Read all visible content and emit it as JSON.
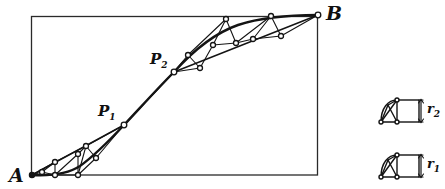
{
  "figure": {
    "type": "geometric-construction-diagram",
    "background": "#ffffff",
    "stroke_color": "#141414",
    "node_fill": "#ffffff",
    "labels": {
      "A": "A",
      "B": "B",
      "P1_base": "P",
      "P1_sub": "1",
      "P2_base": "P",
      "P2_sub": "2",
      "r1_base": "r",
      "r1_sub": "1",
      "r2_base": "r",
      "r2_sub": "2"
    },
    "frame": {
      "x": 31,
      "y": 16,
      "width": 287,
      "height": 159
    },
    "main_curve_note": "S-shaped curve from A through P1 and P2 to B",
    "chord_polyline": [
      [
        32,
        175
      ],
      [
        124,
        125
      ],
      [
        174,
        72
      ],
      [
        318,
        15
      ]
    ],
    "curve_path": [
      [
        32,
        175
      ],
      [
        55,
        175
      ],
      [
        78,
        173
      ],
      [
        96,
        158
      ],
      [
        112,
        140
      ],
      [
        124,
        125
      ],
      [
        140,
        108
      ],
      [
        156,
        90
      ],
      [
        174,
        72
      ],
      [
        196,
        50
      ],
      [
        218,
        35
      ],
      [
        244,
        24
      ],
      [
        272,
        18
      ],
      [
        296,
        16
      ],
      [
        318,
        15
      ]
    ],
    "nodes": [
      {
        "name": "A",
        "x": 32,
        "y": 175
      },
      {
        "name": "n1",
        "x": 42,
        "y": 172
      },
      {
        "name": "n2",
        "x": 55,
        "y": 162
      },
      {
        "name": "n3",
        "x": 55,
        "y": 175
      },
      {
        "name": "n4",
        "x": 78,
        "y": 175
      },
      {
        "name": "n5",
        "x": 78,
        "y": 154
      },
      {
        "name": "n6",
        "x": 86,
        "y": 146
      },
      {
        "name": "n7",
        "x": 96,
        "y": 158
      },
      {
        "name": "P1",
        "x": 124,
        "y": 125
      },
      {
        "name": "P2",
        "x": 174,
        "y": 72
      },
      {
        "name": "n8",
        "x": 188,
        "y": 55
      },
      {
        "name": "n9",
        "x": 200,
        "y": 68
      },
      {
        "name": "n10",
        "x": 213,
        "y": 45
      },
      {
        "name": "n11",
        "x": 226,
        "y": 19
      },
      {
        "name": "n12",
        "x": 236,
        "y": 43
      },
      {
        "name": "n13",
        "x": 253,
        "y": 39
      },
      {
        "name": "n14",
        "x": 271,
        "y": 16
      },
      {
        "name": "n15",
        "x": 281,
        "y": 36
      },
      {
        "name": "B",
        "x": 318,
        "y": 15
      }
    ],
    "insets": [
      {
        "name": "r2-inset",
        "label_base": "r",
        "label_sub": "2",
        "x": 378,
        "y": 97,
        "width": 42,
        "height": 30
      },
      {
        "name": "r1-inset",
        "label_base": "r",
        "label_sub": "1",
        "x": 378,
        "y": 152,
        "width": 42,
        "height": 30
      }
    ]
  }
}
